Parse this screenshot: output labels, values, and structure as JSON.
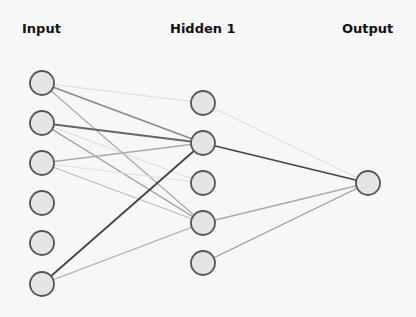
{
  "layers": [
    {
      "name": "Input",
      "label_x": 22,
      "x": 42,
      "nodes": [
        83,
        123,
        163,
        203,
        243,
        284
      ]
    },
    {
      "name": "Hidden 1",
      "label_x": 170,
      "x": 203,
      "nodes": [
        103,
        143,
        183,
        223,
        263
      ]
    },
    {
      "name": "Output",
      "label_x": 342,
      "x": 368,
      "nodes": [
        183
      ]
    }
  ],
  "node_style": {
    "radius": 12,
    "fill": "#e4e4e4",
    "stroke": "#555555"
  },
  "edges": [
    {
      "from": [
        0,
        0
      ],
      "to": [
        1,
        0
      ],
      "color": "#dddddd",
      "width": 1
    },
    {
      "from": [
        0,
        0
      ],
      "to": [
        1,
        1
      ],
      "color": "#888888",
      "width": 1.5
    },
    {
      "from": [
        0,
        0
      ],
      "to": [
        1,
        3
      ],
      "color": "#aaaaaa",
      "width": 1.2
    },
    {
      "from": [
        0,
        1
      ],
      "to": [
        1,
        1
      ],
      "color": "#666666",
      "width": 1.8
    },
    {
      "from": [
        0,
        1
      ],
      "to": [
        1,
        3
      ],
      "color": "#999999",
      "width": 1.3
    },
    {
      "from": [
        0,
        1
      ],
      "to": [
        1,
        2
      ],
      "color": "#dddddd",
      "width": 1
    },
    {
      "from": [
        0,
        2
      ],
      "to": [
        1,
        1
      ],
      "color": "#aaaaaa",
      "width": 1.3
    },
    {
      "from": [
        0,
        2
      ],
      "to": [
        1,
        3
      ],
      "color": "#bbbbbb",
      "width": 1.2
    },
    {
      "from": [
        0,
        2
      ],
      "to": [
        1,
        2
      ],
      "color": "#e0e0e0",
      "width": 1
    },
    {
      "from": [
        0,
        5
      ],
      "to": [
        1,
        1
      ],
      "color": "#444444",
      "width": 1.8
    },
    {
      "from": [
        0,
        5
      ],
      "to": [
        1,
        3
      ],
      "color": "#aaaaaa",
      "width": 1.3
    },
    {
      "from": [
        1,
        0
      ],
      "to": [
        2,
        0
      ],
      "color": "#dddddd",
      "width": 1
    },
    {
      "from": [
        1,
        1
      ],
      "to": [
        2,
        0
      ],
      "color": "#444444",
      "width": 1.6
    },
    {
      "from": [
        1,
        3
      ],
      "to": [
        2,
        0
      ],
      "color": "#aaaaaa",
      "width": 1.3
    },
    {
      "from": [
        1,
        4
      ],
      "to": [
        2,
        0
      ],
      "color": "#999999",
      "width": 1.3
    }
  ]
}
